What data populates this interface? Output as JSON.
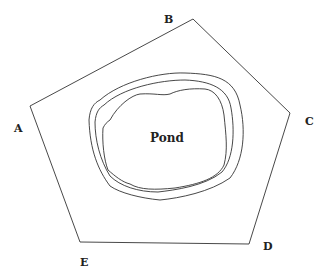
{
  "diagram": {
    "title": "",
    "vertices": [
      {
        "id": "A",
        "label": "A",
        "x": 30,
        "y": 106,
        "lx": 14,
        "ly": 122
      },
      {
        "id": "B",
        "label": "B",
        "x": 193,
        "y": 19,
        "lx": 164,
        "ly": 13
      },
      {
        "id": "C",
        "label": "C",
        "x": 290,
        "y": 113,
        "lx": 305,
        "ly": 115
      },
      {
        "id": "D",
        "label": "D",
        "x": 249,
        "y": 244,
        "lx": 263,
        "ly": 240
      },
      {
        "id": "E",
        "label": "E",
        "x": 80,
        "y": 242,
        "lx": 80,
        "ly": 256
      }
    ],
    "pond_label": "Pond",
    "colors": {
      "stroke": "#333333",
      "background": "#ffffff"
    }
  }
}
